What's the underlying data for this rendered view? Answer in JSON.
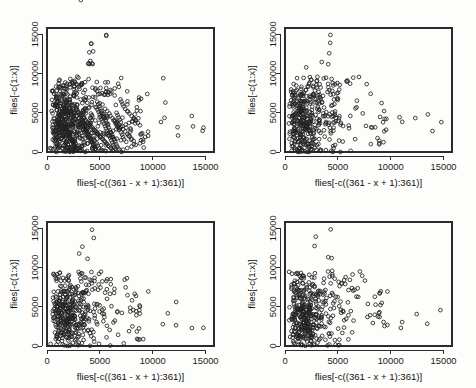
{
  "figure": {
    "type": "scatterplot-matrix",
    "rows": 2,
    "columns": 2,
    "background_color": "#fdfdfb",
    "foreground_color": "#1a1a1a",
    "point_symbol": "open-circle"
  },
  "chart_data": [
    {
      "type": "scatter",
      "panel": "top-left",
      "title": "",
      "xlabel": "flies[-c((361 - x + 1):361)]",
      "ylabel": "flies[-c(1:x)]",
      "xlim": [
        0,
        15800
      ],
      "ylim": [
        0,
        15800
      ],
      "xticks": [
        0,
        5000,
        10000,
        15000
      ],
      "yticks": [
        0,
        5000,
        10000,
        15000
      ],
      "xticklabels": [
        "0",
        "5000",
        "10000",
        "15000"
      ],
      "yticklabels": [
        "0",
        "5000",
        "10000",
        "15000"
      ],
      "grid": false,
      "legend": null,
      "marker": "open-circle",
      "x": [
        5600,
        4200,
        4000,
        4100,
        4050,
        3900,
        3950,
        1200,
        1500,
        2200,
        2400,
        2600,
        3000,
        3300,
        3600,
        4300,
        4600,
        5000,
        5400,
        5800,
        6100,
        6400,
        900,
        1100,
        1300,
        1600,
        1800,
        2000,
        2100,
        2300,
        2500,
        2700,
        2900,
        3100,
        3200,
        3400,
        3500,
        3700,
        3800,
        4400,
        4500,
        4700,
        4800,
        4900,
        5100,
        5200,
        5300,
        5500,
        5700,
        5900,
        6000,
        6200,
        6300,
        6500,
        6600,
        6700,
        6800,
        7000,
        7100,
        7200,
        7300,
        7500,
        7700,
        7900,
        8100,
        8300,
        8500,
        8700,
        8900,
        9000,
        11000,
        11200,
        12400,
        13700,
        14800,
        700,
        800,
        1000,
        1400,
        1700,
        1900,
        2800,
        3050,
        3150,
        3250,
        3450,
        3550,
        3650,
        3750,
        3850,
        3920,
        4150,
        4250,
        4350,
        4450,
        4550,
        4650,
        4750,
        4850,
        4950,
        5050,
        5150,
        5250,
        5350,
        5450,
        5550,
        5650,
        5750,
        5850,
        5950,
        6050,
        6150,
        6250,
        6350,
        6450,
        6550,
        6650,
        6750,
        6850,
        6950,
        7050,
        7150,
        7250,
        7400,
        7600,
        7800,
        8000,
        8200,
        8400,
        8600,
        8800,
        600,
        650,
        750,
        850,
        950,
        1050,
        1150,
        1250,
        1350,
        1450,
        1550,
        1650,
        1750,
        1850,
        1950,
        2050,
        2150,
        2250,
        2350,
        2450,
        2550,
        2650,
        2750,
        2850,
        2950,
        3080,
        3180,
        3280,
        3380,
        3480,
        3580,
        3680,
        3780,
        3880,
        3980,
        4080,
        4180,
        4280,
        4380,
        4480,
        4580,
        4680,
        4780,
        4880,
        4980,
        5080,
        5180,
        5280,
        5380,
        5480,
        5580,
        5680,
        5780,
        5880,
        5980,
        6080,
        6180,
        6280,
        6380,
        6480,
        6580,
        6680,
        6780,
        6880,
        6980,
        1100,
        1300,
        1500,
        1700,
        1900,
        2100,
        2300,
        2500,
        2700,
        2900,
        3100,
        3300,
        3500,
        3700,
        3900,
        4100,
        4300,
        4500,
        4700,
        4900,
        5100,
        5300,
        5500,
        5700,
        5900,
        6100,
        6300,
        6500,
        6700,
        6900,
        800,
        1000,
        1200,
        1400,
        1600,
        1800,
        2000,
        2200,
        2400,
        2600,
        2800,
        3000,
        3200,
        3400,
        3600,
        3800,
        4000,
        4200,
        4400,
        4600,
        4800,
        5000,
        5200,
        5400,
        5600,
        5800,
        6000,
        6200,
        6400,
        6600,
        6800,
        7000,
        7200,
        7400,
        7600,
        7800,
        8000,
        8200,
        900,
        1150,
        1450,
        1750,
        2050,
        2350,
        2650,
        2950,
        3250,
        3550,
        3850,
        4150,
        4450,
        4750,
        5050,
        5350,
        5650,
        5950,
        6250,
        6550,
        6850,
        7150,
        7450,
        7750,
        8050,
        8350,
        8650,
        4300,
        4250,
        4150,
        3500,
        3700,
        3600,
        4000,
        2500,
        2600,
        2200,
        1800,
        1400,
        1000,
        900,
        1600,
        5200,
        5600,
        6000,
        6400,
        6800,
        7200,
        7600,
        8000,
        8400,
        8800,
        9100,
        7000,
        6600,
        6200,
        5800,
        5400,
        5000,
        4600,
        4200,
        3800,
        3400,
        3000,
        2600,
        2200,
        1800,
        1400,
        1000,
        1200,
        1600,
        2000,
        2400,
        2800,
        3200
      ],
      "y": [
        14900,
        13800,
        12700,
        11600,
        11200,
        11250,
        11300,
        9200,
        8500,
        8700,
        8800,
        8400,
        8300,
        8600,
        8900,
        8200,
        8100,
        7400,
        7300,
        7600,
        7700,
        7200,
        6800,
        6500,
        6200,
        5900,
        5600,
        5300,
        5000,
        4700,
        4400,
        4100,
        3800,
        3500,
        3200,
        2900,
        2600,
        2300,
        2000,
        1700,
        1400,
        1100,
        800,
        500,
        300,
        200,
        150,
        5500,
        5200,
        4900,
        4600,
        4300,
        4000,
        3700,
        3400,
        3100,
        2800,
        2500,
        2200,
        1900,
        1600,
        1300,
        2100,
        3000,
        3900,
        4800,
        5700,
        6600,
        1500,
        2400,
        9400,
        6300,
        2100,
        4600,
        3100,
        1400,
        6100,
        5800,
        5500,
        5200,
        4900,
        4600,
        4300,
        4000,
        3700,
        3400,
        3100,
        2800,
        2500,
        2200,
        1900,
        1600,
        1300,
        1000,
        700,
        400,
        250,
        6400,
        6100,
        5800,
        5500,
        5200,
        4900,
        4600,
        4300,
        4000,
        3700,
        3400,
        3100,
        2800,
        2500,
        2200,
        1900,
        1600,
        1300,
        1000,
        700,
        450,
        300,
        6700,
        6400,
        6100,
        5800,
        5500,
        5200,
        4900,
        4600,
        4300,
        4000,
        3700,
        3400,
        3100,
        2800,
        2500,
        2200,
        1900,
        1600,
        5100,
        4800,
        4500,
        4200,
        3900,
        3600,
        3300,
        3000,
        2700,
        2400,
        2100,
        1800,
        1500,
        1200,
        900,
        600,
        350,
        5400,
        5100,
        4800,
        4500,
        4200,
        3900,
        3600,
        3300,
        3000,
        2700,
        2400,
        2100,
        1800,
        1500,
        1200,
        900,
        600,
        400,
        5700,
        5400,
        5100,
        4800,
        4500,
        4200,
        3900,
        3600,
        3300,
        3000,
        2700,
        2400,
        2100,
        1800,
        1500,
        1200,
        900,
        650,
        400,
        5000,
        4700,
        4400,
        4100,
        3800,
        3500,
        3200,
        2900,
        2600,
        2300,
        2000,
        1700,
        1400,
        1100,
        800,
        500,
        250,
        4300,
        4000,
        3700,
        3400,
        3100,
        2800,
        2500,
        2200,
        1900,
        1600,
        1300,
        1000,
        700,
        400,
        200,
        3600,
        3300,
        3000,
        2700,
        2400,
        2100,
        1800,
        1500,
        1200,
        900,
        600,
        300,
        150,
        5300,
        5000,
        4700,
        4400,
        4100,
        3800,
        3500,
        3200,
        2900,
        2600,
        2300,
        2000,
        1700,
        1400,
        1100,
        800,
        500,
        200,
        4100,
        3800,
        3500,
        3200,
        2900,
        2600,
        2300,
        2000,
        1700,
        1400,
        1100,
        800,
        500,
        300,
        100,
        200,
        350,
        500,
        700,
        900,
        1100,
        1300,
        1500,
        1700,
        1900,
        2100,
        2300,
        2500,
        2700,
        2900,
        3100,
        3300,
        3500,
        3700,
        3900,
        4100,
        4300,
        4500,
        4700,
        4900,
        5100,
        5300,
        5500,
        5700,
        5900,
        6100,
        6300,
        6500,
        6700,
        6900,
        7100,
        7300,
        7500,
        7700,
        7900,
        8100,
        8300,
        300,
        500,
        700,
        900,
        1100,
        1300,
        1500,
        1700,
        1900,
        2100,
        2300,
        2500,
        2700,
        2900,
        3100,
        3300,
        3500,
        3700,
        3900,
        4100,
        4300,
        4500,
        4700,
        4900,
        5100,
        5300,
        5500
      ]
    },
    {
      "type": "scatter",
      "panel": "top-right",
      "title": "",
      "xlabel": "flies[-c((361 - x + 1):361)]",
      "ylabel": "flies[-c(1:x)]",
      "xlim": [
        0,
        15800
      ],
      "ylim": [
        0,
        15800
      ],
      "xticks": [
        0,
        5000,
        10000,
        15000
      ],
      "yticks": [
        0,
        5000,
        10000,
        15000
      ],
      "xticklabels": [
        "0",
        "5000",
        "10000",
        "15000"
      ],
      "yticklabels": [
        "0",
        "5000",
        "10000",
        "15000"
      ],
      "grid": false,
      "legend": null,
      "marker": "open-circle"
    },
    {
      "type": "scatter",
      "panel": "bottom-left",
      "title": "",
      "xlabel": "flies[-c((361 - x + 1):361)]",
      "ylabel": "flies[-c(1:x)]",
      "xlim": [
        0,
        15800
      ],
      "ylim": [
        0,
        15800
      ],
      "xticks": [
        0,
        5000,
        10000,
        15000
      ],
      "yticks": [
        0,
        5000,
        10000,
        15000
      ],
      "xticklabels": [
        "0",
        "5000",
        "10000",
        "15000"
      ],
      "yticklabels": [
        "0",
        "5000",
        "10000",
        "15000"
      ],
      "grid": false,
      "legend": null,
      "marker": "open-circle"
    },
    {
      "type": "scatter",
      "panel": "bottom-right",
      "title": "",
      "xlabel": "flies[-c((361 - x + 1):361)]",
      "ylabel": "flies[-c(1:x)]",
      "xlim": [
        0,
        15800
      ],
      "ylim": [
        0,
        15800
      ],
      "xticks": [
        0,
        5000,
        10000,
        15000
      ],
      "yticks": [
        0,
        5000,
        10000,
        15000
      ],
      "xticklabels": [
        "0",
        "5000",
        "10000",
        "15000"
      ],
      "yticklabels": [
        "0",
        "5000",
        "10000",
        "15000"
      ],
      "grid": false,
      "legend": null,
      "marker": "open-circle"
    }
  ]
}
